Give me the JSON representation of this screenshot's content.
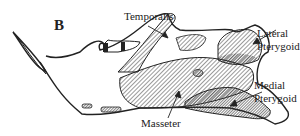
{
  "figure": {
    "panel_label": "B",
    "labels": {
      "temporalis": "Temporalis",
      "lateral_1": "Lateral",
      "lateral_2": "Pterygoid",
      "medial_1": "Medial",
      "medial_2": "Pterygoid",
      "masseter": "Masseter"
    },
    "colors": {
      "ink": "#222222",
      "hatch": "#555555",
      "background": "#ffffff"
    }
  }
}
